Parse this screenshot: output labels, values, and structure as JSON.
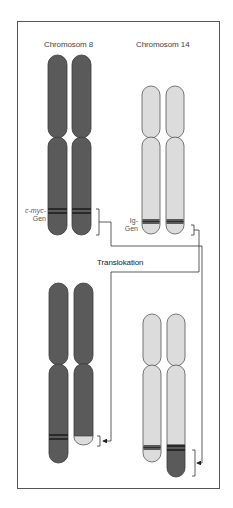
{
  "diagram": {
    "type": "chromosome-translocation",
    "labels": {
      "chromosome_8": "Chromosom 8",
      "chromosome_14": "Chromosom 14",
      "cmyc_gene_line1": "c-myc-",
      "cmyc_gene_line2": "Gen",
      "ig_gene_line1": "Ig-",
      "ig_gene_line2": "Gen",
      "translocation": "Translokation"
    },
    "colors": {
      "chromosome_8": "#5a5a5a",
      "chromosome_14": "#dcdcdc",
      "band": "#2e2e2e",
      "outline": "#444444",
      "frame": "#555555"
    },
    "nodes": [
      {
        "id": "chr8-before",
        "label": "Chromosom 8 (pair, before)"
      },
      {
        "id": "chr14-before",
        "label": "Chromosom 14 (pair, before)"
      },
      {
        "id": "chr8-after",
        "label": "Chromosom 8 (after translocation)"
      },
      {
        "id": "chr14-after",
        "label": "Chromosom 14 (after translocation)"
      }
    ],
    "edges": [
      {
        "from": "chr8-before c-myc-Gen",
        "to": "chr14-after",
        "label": "Translokation"
      },
      {
        "from": "chr14-before Ig-Gen",
        "to": "chr8-after",
        "label": "Translokation"
      }
    ]
  }
}
